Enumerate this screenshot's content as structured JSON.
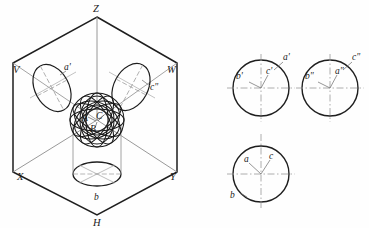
{
  "figure": {
    "background_color": "#fefefe",
    "ink_color": "#1a1a1a",
    "thin_line_color": "#8d8d8d",
    "dash_line_color": "#9a9a9a"
  },
  "pictorial": {
    "name": "isometric-projection-box",
    "plane_labels": {
      "V": "V",
      "W": "W",
      "H": "H"
    },
    "axis_labels": {
      "Z": "Z",
      "X": "X",
      "Y": "Y"
    },
    "point_labels": {
      "A": "A",
      "B": "B",
      "C": "C"
    },
    "projection_labels": {
      "a_front": "a'",
      "c_side": "c\"",
      "b_top": "b"
    },
    "geometry": {
      "hex_vertices": [
        [
          97,
          17
        ],
        [
          177,
          63
        ],
        [
          177,
          172
        ],
        [
          97,
          215
        ],
        [
          13,
          172
        ],
        [
          13,
          63
        ]
      ],
      "center": [
        97,
        120
      ],
      "sphere_radius": 27,
      "v_ellipse": {
        "cx": 52,
        "cy": 88,
        "rx": 17,
        "ry": 25,
        "rot": -28
      },
      "w_ellipse": {
        "cx": 131,
        "cy": 87,
        "rx": 17,
        "ry": 25,
        "rot": 28
      },
      "h_ellipse": {
        "cx": 97,
        "cy": 174,
        "rx": 24,
        "ry": 12,
        "rot": 0
      }
    }
  },
  "views": {
    "front_view": {
      "name": "front-view",
      "cx": 261,
      "cy": 88,
      "r": 28,
      "labels": {
        "a": "a'",
        "b": "b'",
        "c": "c'"
      }
    },
    "side_view": {
      "name": "side-view",
      "cx": 330,
      "cy": 88,
      "r": 28,
      "labels": {
        "a": "a\"",
        "b": "b\"",
        "c": "c\""
      }
    },
    "top_view": {
      "name": "top-view",
      "cx": 261,
      "cy": 174,
      "r": 28,
      "labels": {
        "a": "a",
        "b": "b",
        "c": "c"
      }
    }
  }
}
